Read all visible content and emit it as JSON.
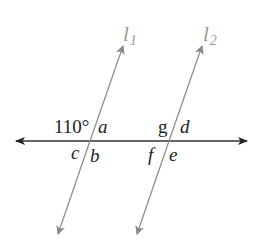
{
  "diagram": {
    "type": "parallel-lines-transversal",
    "transversal": {
      "color": "#333333",
      "y": 141,
      "x1": 14,
      "x2": 248
    },
    "lines": [
      {
        "name": "l",
        "subscript": "1",
        "color": "#8a8a8a",
        "top": [
          123,
          45
        ],
        "bottom": [
          58,
          235
        ],
        "intersection": [
          90,
          141
        ]
      },
      {
        "name": "l",
        "subscript": "2",
        "color": "#8a8a8a",
        "top": [
          202,
          45
        ],
        "bottom": [
          137,
          235
        ],
        "intersection": [
          169,
          141
        ]
      }
    ],
    "angle_labels": {
      "given": "110°",
      "a": "a",
      "b": "b",
      "c": "c",
      "d": "d",
      "e": "e",
      "f": "f",
      "g": "g"
    }
  }
}
